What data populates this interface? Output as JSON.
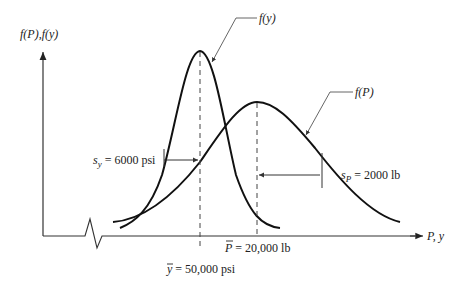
{
  "diagram": {
    "title": "",
    "y_axis_label": "f(P), f(y)",
    "x_axis_label": "P, y",
    "curves": [
      {
        "name": "f(y)",
        "label": "f(y)",
        "mean_label": "ȳ = 50,000 psi",
        "std_label": "s_y = 6000 psi",
        "mean": "50,000 psi",
        "std": "6000 psi"
      },
      {
        "name": "f(P)",
        "label": "f(P)",
        "mean_label": "P̄ = 20,000 lb",
        "std_label": "s_P = 2000 lb",
        "mean": "20,000 lb",
        "std": "2000 lb"
      }
    ],
    "labels": {
      "fy": "f(y)",
      "fP": "f(P)",
      "sy_prefix": "s",
      "sy_sub": "y",
      "sy_rest": " = 6000 psi",
      "sP_prefix": "s",
      "sP_sub": "P",
      "sP_rest": " = 2000 lb",
      "Pbar_sym": "P",
      "Pbar_rest": " = 20,000 lb",
      "ybar_sym": "y",
      "ybar_rest": " = 50,000 psi",
      "yaxis": "f(P),f(y)",
      "xaxis": "P, y"
    },
    "colors": {
      "curve": "#111111",
      "axis": "#333333",
      "leader": "#555555"
    }
  }
}
